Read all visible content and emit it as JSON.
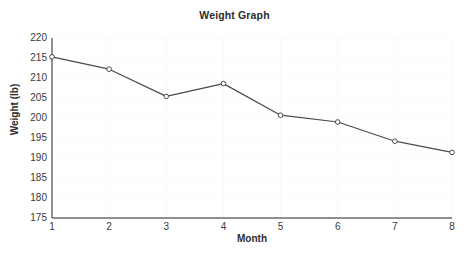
{
  "chart_data": {
    "type": "line",
    "title": "Weight Graph",
    "xlabel": "Month",
    "ylabel": "Weight (lb)",
    "x": [
      1,
      2,
      3,
      4,
      5,
      6,
      7,
      8
    ],
    "values": [
      215.3,
      212.2,
      205.4,
      208.6,
      200.7,
      199.0,
      194.2,
      191.4
    ],
    "series": [
      {
        "name": "Weight",
        "values": [
          215.3,
          212.2,
          205.4,
          208.6,
          200.7,
          199.0,
          194.2,
          191.4
        ]
      }
    ],
    "categories": [
      "1",
      "2",
      "3",
      "4",
      "5",
      "6",
      "7",
      "8"
    ],
    "xlim": [
      1,
      8
    ],
    "ylim": [
      175,
      220
    ],
    "ytick_labels": [
      "220",
      "215",
      "210",
      "205",
      "200",
      "195",
      "190",
      "185",
      "180",
      "175"
    ],
    "ytick_values": [
      220,
      215,
      210,
      205,
      200,
      195,
      190,
      185,
      180,
      175
    ],
    "xtick_labels": [
      "1",
      "2",
      "3",
      "4",
      "5",
      "6",
      "7",
      "8"
    ],
    "xtick_values": [
      1,
      2,
      3,
      4,
      5,
      6,
      7,
      8
    ],
    "grid": true,
    "legend": false,
    "legend_position": "none",
    "marker": "open-circle",
    "line_color": "#4a4a4a",
    "marker_color": "#4a4a4a",
    "grid_color": "#fafafa",
    "axis_color": "#4a4a4a",
    "background_color": "#ffffff"
  }
}
